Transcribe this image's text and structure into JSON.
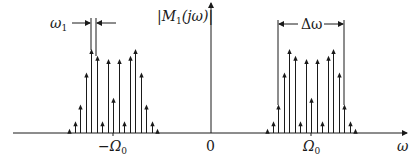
{
  "diagram": {
    "y_axis_label": {
      "prefix": "|M",
      "sub": "1",
      "suffix": "(jω)|"
    },
    "x_axis_label": "ω",
    "origin_label": "0",
    "left_center_label": {
      "sign": "−",
      "sym": "Ω",
      "sub": "0"
    },
    "right_center_label": {
      "sym": "Ω",
      "sub": "0"
    },
    "spacing_label": {
      "sym": "ω",
      "sub": "1"
    },
    "bandwidth_label": "Δω",
    "colors": {
      "stroke": "#1a1a1a",
      "background": "#ffffff"
    }
  },
  "chart_data": {
    "type": "stem",
    "title": "",
    "xlabel": "ω",
    "ylabel": "|M1(jω)|",
    "x_ticks": [
      "-Ω0",
      "0",
      "Ω0"
    ],
    "clusters": [
      {
        "name": "negative-frequency band",
        "center": "-Ω0",
        "relative_offsets": [
          -8,
          -7,
          -6,
          -5,
          -4,
          -3,
          -2,
          -1,
          0,
          1,
          2,
          3,
          4,
          5,
          6,
          7,
          8
        ],
        "relative_heights": [
          0.05,
          0.14,
          0.34,
          0.72,
          1.0,
          0.92,
          0.14,
          0.88,
          0.42,
          0.88,
          0.14,
          0.92,
          1.0,
          0.72,
          0.34,
          0.14,
          0.05
        ]
      },
      {
        "name": "positive-frequency band",
        "center": "Ω0",
        "relative_offsets": [
          -8,
          -7,
          -6,
          -5,
          -4,
          -3,
          -2,
          -1,
          0,
          1,
          2,
          3,
          4,
          5,
          6,
          7,
          8
        ],
        "relative_heights": [
          0.05,
          0.14,
          0.34,
          0.72,
          1.0,
          0.92,
          0.14,
          0.88,
          0.42,
          0.88,
          0.14,
          0.92,
          1.0,
          0.72,
          0.34,
          0.14,
          0.05
        ]
      }
    ],
    "annotations": [
      {
        "text": "ω1",
        "meaning": "spacing between adjacent spectral lines"
      },
      {
        "text": "Δω",
        "meaning": "bandwidth of significant components"
      }
    ]
  }
}
